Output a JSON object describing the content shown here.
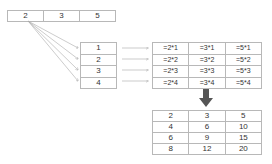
{
  "top_row": [
    "2",
    "3",
    "5"
  ],
  "index_column": [
    "1",
    "2",
    "3",
    "4"
  ],
  "formula_table": [
    [
      "=2*1",
      "=3*1",
      "=5*1"
    ],
    [
      "=2*2",
      "=3*2",
      "=5*2"
    ],
    [
      "=2*3",
      "=3*3",
      "=5*3"
    ],
    [
      "=2*4",
      "=3*4",
      "=5*4"
    ]
  ],
  "result_table": [
    [
      "2",
      "3",
      "5"
    ],
    [
      "4",
      "6",
      "10"
    ],
    [
      "6",
      "9",
      "15"
    ],
    [
      "8",
      "12",
      "20"
    ]
  ],
  "colors": {
    "border": "#b8b8b8",
    "arrow": "#aaaaaa",
    "down_arrow": "#555555"
  }
}
